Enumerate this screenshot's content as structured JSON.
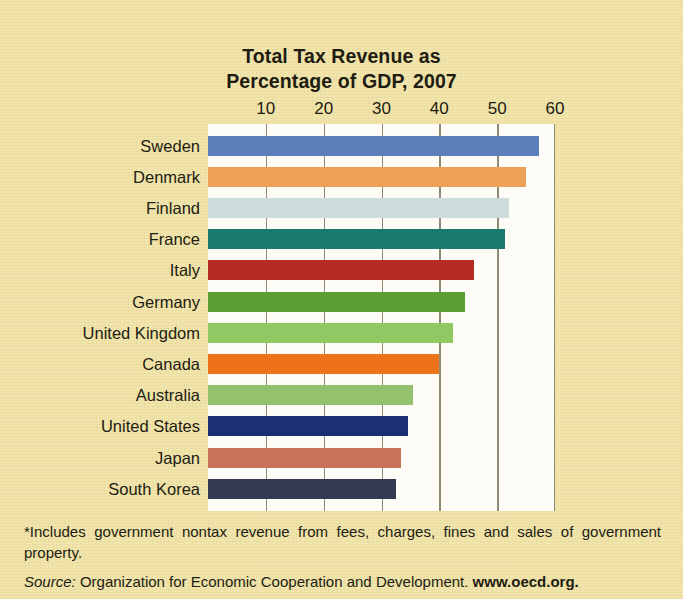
{
  "chart_data": {
    "type": "bar",
    "orientation": "horizontal",
    "title": "Total Tax Revenue as Percentage of GDP, 2007",
    "title_lines": [
      "Total Tax Revenue as",
      "Percentage of GDP, 2007"
    ],
    "xlabel": "",
    "ylabel": "",
    "xlim": [
      0,
      60
    ],
    "grid": true,
    "grid_axis": "x",
    "legend": "none",
    "axis_position": "top",
    "tick_labels": [
      "10",
      "20",
      "30",
      "40",
      "50",
      "60"
    ],
    "ticks": [
      10,
      20,
      30,
      40,
      50,
      60
    ],
    "categories": [
      "Sweden",
      "Denmark",
      "Finland",
      "France",
      "Italy",
      "Germany",
      "United Kingdom",
      "Canada",
      "Australia",
      "United States",
      "Japan",
      "South Korea"
    ],
    "values": [
      57.3,
      54.9,
      52.0,
      51.3,
      46.0,
      44.4,
      42.3,
      40.0,
      35.4,
      34.5,
      33.3,
      32.5
    ],
    "colors": [
      "#5a7fba",
      "#eda258",
      "#cbdcdb",
      "#197a70",
      "#b62b22",
      "#5c9e31",
      "#90c864",
      "#ee7219",
      "#94c26c",
      "#1b2f74",
      "#c9735a",
      "#323b52"
    ],
    "bars": [
      {
        "category": "Sweden",
        "value": 57.3,
        "color": "#5a7fba"
      },
      {
        "category": "Denmark",
        "value": 54.9,
        "color": "#eda258"
      },
      {
        "category": "Finland",
        "value": 52.0,
        "color": "#cbdcdb"
      },
      {
        "category": "France",
        "value": 51.3,
        "color": "#197a70"
      },
      {
        "category": "Italy",
        "value": 46.0,
        "color": "#b62b22"
      },
      {
        "category": "Germany",
        "value": 44.4,
        "color": "#5c9e31"
      },
      {
        "category": "United Kingdom",
        "value": 42.3,
        "color": "#90c864"
      },
      {
        "category": "Canada",
        "value": 40.0,
        "color": "#ee7219"
      },
      {
        "category": "Australia",
        "value": 35.4,
        "color": "#94c26c"
      },
      {
        "category": "United States",
        "value": 34.5,
        "color": "#1b2f74"
      },
      {
        "category": "Japan",
        "value": 33.3,
        "color": "#c9735a"
      },
      {
        "category": "South Korea",
        "value": 32.5,
        "color": "#323b52"
      }
    ]
  },
  "footnote": "*Includes government nontax revenue from fees, charges, fines and sales of government property.",
  "source": {
    "label": "Source:",
    "text": "Organization for Economic Cooperation and Development.",
    "url": "www.oecd.org."
  },
  "style": {
    "background": "#f2e3a6",
    "plot_background": "#fdfcf7",
    "gridline_color": "#8f8a74",
    "text_color": "#211c12"
  }
}
